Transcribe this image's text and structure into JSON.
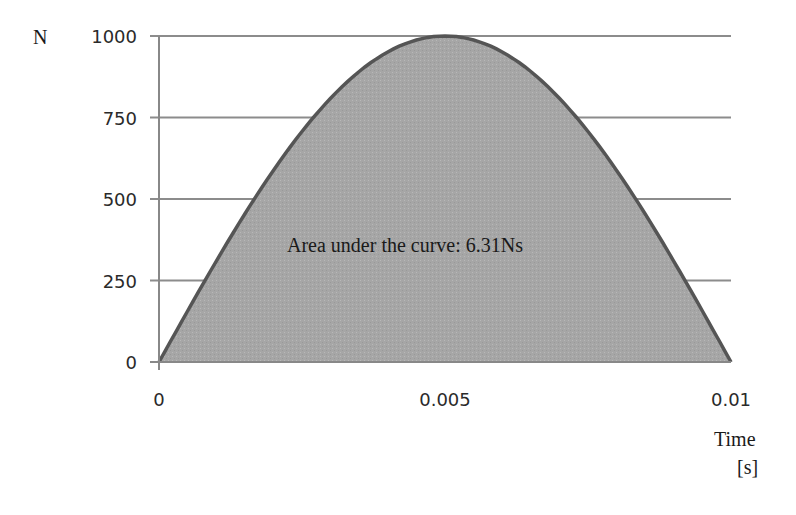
{
  "chart_data": {
    "type": "area",
    "title": "",
    "xlabel": "Time [s]",
    "ylabel": "N",
    "xlim": [
      0,
      0.01
    ],
    "ylim": [
      0,
      1000
    ],
    "x_ticks": [
      "0",
      "0.005",
      "0.01"
    ],
    "y_ticks": [
      "0",
      "250",
      "500",
      "750",
      "1000"
    ],
    "grid": {
      "horizontal": true,
      "vertical": false
    },
    "legend": null,
    "series": [
      {
        "name": "Force",
        "shape": "half-sine",
        "x": [
          0,
          0.001,
          0.002,
          0.003,
          0.004,
          0.005,
          0.006,
          0.007,
          0.008,
          0.009,
          0.01
        ],
        "values": [
          0,
          309,
          588,
          809,
          951,
          1000,
          951,
          809,
          588,
          309,
          0
        ]
      }
    ],
    "annotations": [
      {
        "text": "Area under the curve: 6.31Ns",
        "x": 0.0055,
        "y": 430
      }
    ]
  },
  "labels": {
    "y_unit": "N",
    "x_label_line1": "Time",
    "x_label_line2": "[s]",
    "annotation": "Area under the curve: 6.31Ns"
  },
  "colors": {
    "fill": "#a9a9a9",
    "line": "#555555",
    "grid": "#8c8c8c",
    "axis": "#888888"
  }
}
